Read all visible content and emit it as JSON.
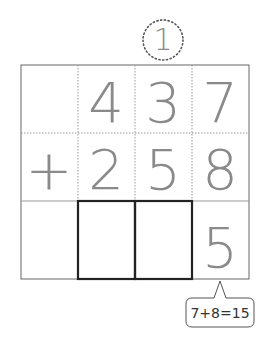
{
  "worksheet": {
    "type": "vertical-addition",
    "carry": {
      "digit": "1",
      "column": "tens"
    },
    "rows": [
      {
        "operator": "",
        "digits": [
          "4",
          "3",
          "7"
        ]
      },
      {
        "operator": "+",
        "digits": [
          "2",
          "5",
          "8"
        ]
      }
    ],
    "answer": {
      "digits": [
        "",
        "",
        "5"
      ],
      "blank_boxes": [
        "hundreds",
        "tens"
      ]
    },
    "hint": {
      "text": "7+8=15"
    }
  },
  "colors": {
    "digit": "#8a8a8a",
    "grid_border": "#555555",
    "grid_dotted": "#999999",
    "answer_box": "#222222"
  }
}
